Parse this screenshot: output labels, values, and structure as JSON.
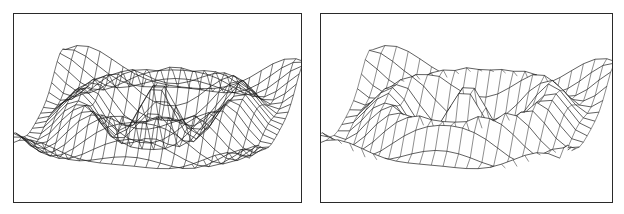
{
  "figure": {
    "panels": [
      {
        "id": "left",
        "caption": "",
        "style": "wireframe",
        "draw_rows": true,
        "draw_cols": true
      },
      {
        "id": "right",
        "caption": "",
        "style": "hidden-line-rows",
        "draw_rows": true,
        "draw_cols": true
      }
    ]
  },
  "chart_data": [
    {
      "type": "surface-wireframe",
      "title": "",
      "xlabel": "",
      "ylabel": "",
      "zlabel": "",
      "grid": false,
      "legend": "none",
      "function": "z = cos(r) with ripples, radially symmetric damped wave (sinc-like)",
      "mesh": {
        "rows": 22,
        "cols": 22,
        "xrange": [
          -1,
          1
        ],
        "yrange": [
          -1,
          1
        ]
      },
      "description": "3D wireframe of radially oscillating surface: central dome with rim ridge and outer spiky ring"
    },
    {
      "type": "surface-wireframe",
      "title": "",
      "xlabel": "",
      "ylabel": "",
      "zlabel": "",
      "grid": false,
      "legend": "none",
      "function": "same surface rendered with hidden-line removal, smoother row curves",
      "mesh": {
        "rows": 16,
        "cols": 22,
        "xrange": [
          -1,
          1
        ],
        "yrange": [
          -1,
          1
        ]
      },
      "description": "Same radially symmetric surface, fewer mesh lines, hidden lines removed"
    }
  ],
  "colors": {
    "line": "#1a1a1a",
    "frame": "#2a2a2a",
    "background": "#ffffff"
  }
}
